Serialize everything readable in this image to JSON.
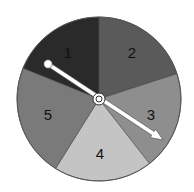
{
  "spinner": {
    "center": [
      99,
      99
    ],
    "radius": 82,
    "sections": [
      {
        "label": "1",
        "color": "#2a2a2a",
        "start_deg": -90,
        "end_deg": -158,
        "label_pos": [
          68,
          54
        ]
      },
      {
        "label": "2",
        "color": "#5a5a5a",
        "start_deg": -90,
        "end_deg": -18,
        "label_pos": [
          132,
          54
        ]
      },
      {
        "label": "3",
        "color": "#8e8e8e",
        "start_deg": -18,
        "end_deg": 52,
        "label_pos": [
          151,
          116
        ]
      },
      {
        "label": "4",
        "color": "#c4c4c4",
        "start_deg": 52,
        "end_deg": 122,
        "label_pos": [
          100,
          155
        ]
      },
      {
        "label": "5",
        "color": "#7a7a7a",
        "start_deg": 122,
        "end_deg": 202,
        "label_pos": [
          48,
          116
        ]
      }
    ],
    "pointer": {
      "tail": [
        48,
        64
      ],
      "head": [
        163,
        140
      ],
      "color": "#ffffff",
      "outline": "#555555"
    }
  }
}
